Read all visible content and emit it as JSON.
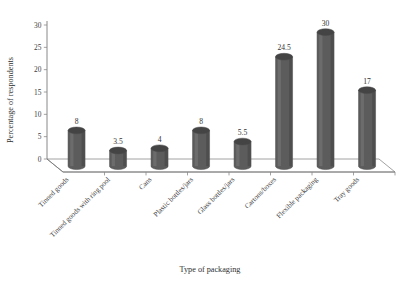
{
  "chart_data": {
    "type": "bar",
    "title": "",
    "xlabel": "Type of packaging",
    "ylabel": "Percentage of respondents",
    "categories": [
      "Tinned goods",
      "Tinned goods with ring pool",
      "Cans",
      "Plastic bottles/jars",
      "Glass bottles/jars",
      "Cartons/boxes",
      "Flexible packaging",
      "Tray goods"
    ],
    "values": [
      8,
      3.5,
      4,
      8,
      5.5,
      24.5,
      30,
      17
    ],
    "value_labels": [
      "8",
      "3.5",
      "4",
      "8",
      "5.5",
      "24.5",
      "30",
      "17"
    ],
    "ylim": [
      0,
      30
    ],
    "yticks": [
      0,
      5,
      10,
      15,
      20,
      25,
      30
    ],
    "ytick_labels": [
      "0",
      "5",
      "10",
      "15",
      "20",
      "25",
      "30"
    ],
    "grid": false,
    "legend": false,
    "style": "3d-cylinder",
    "bar_color": "#5c5c5c",
    "bar_color_light": "#7a7a7a",
    "bar_color_dark": "#444444",
    "axis_color": "#7a7a7a",
    "background": "#ffffff"
  }
}
